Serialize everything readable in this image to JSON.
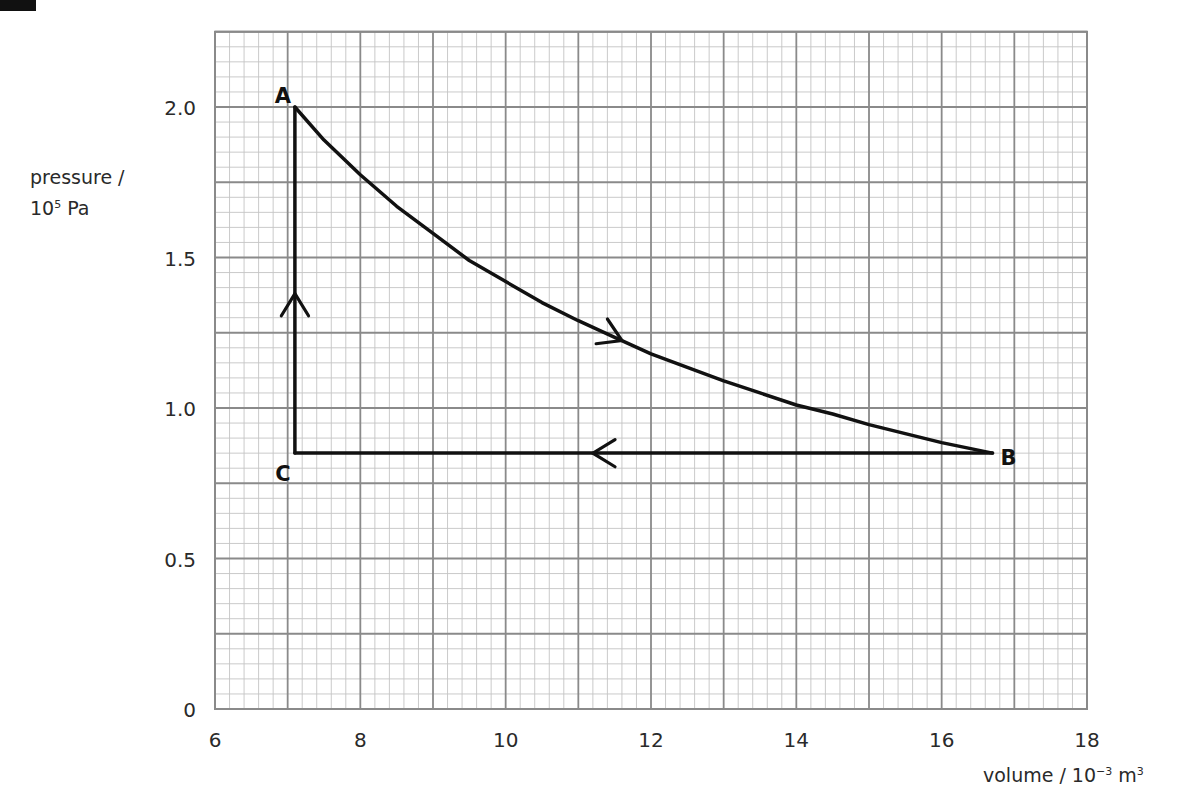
{
  "chart_data": {
    "type": "line",
    "title": "",
    "xlabel": "volume / 10⁻³ m³",
    "xlabel_parts": {
      "main": "volume / 10",
      "sup": "−3",
      "unit": " m",
      "unit_sup": "3"
    },
    "ylabel": "pressure / 10⁵ Pa",
    "ylabel_parts": {
      "line1": "pressure /",
      "base": "10",
      "sup": "5",
      "unit": " Pa"
    },
    "xlim": [
      6,
      18
    ],
    "ylim": [
      0,
      2.25
    ],
    "x_ticks": [
      6,
      8,
      10,
      12,
      14,
      16,
      18
    ],
    "x_tick_labels": [
      "6",
      "8",
      "10",
      "12",
      "14",
      "16",
      "18"
    ],
    "y_ticks": [
      0,
      0.5,
      1.0,
      1.5,
      2.0
    ],
    "y_tick_labels": [
      "0",
      "0.5",
      "1.0",
      "1.5",
      "2.0"
    ],
    "grid": {
      "on": true,
      "x_major_step": 1,
      "x_minor_step": 0.2,
      "y_major_step": 0.25,
      "y_minor_step": 0.05,
      "major_color": "#8a8a8a",
      "minor_color": "#c4c4c4"
    },
    "line_color": "#111111",
    "points": [
      {
        "label": "A",
        "volume": 7.1,
        "pressure": 2.0
      },
      {
        "label": "B",
        "volume": 16.7,
        "pressure": 0.85
      },
      {
        "label": "C",
        "volume": 7.1,
        "pressure": 0.85
      }
    ],
    "series": [
      {
        "name": "A→B (isothermal expansion curve)",
        "x": [
          7.1,
          7.5,
          8.0,
          8.5,
          9.0,
          9.5,
          10.0,
          10.5,
          11.0,
          11.5,
          12.0,
          12.5,
          13.0,
          13.5,
          14.0,
          14.5,
          15.0,
          15.5,
          16.0,
          16.7
        ],
        "y": [
          2.0,
          1.89,
          1.775,
          1.67,
          1.58,
          1.49,
          1.42,
          1.35,
          1.29,
          1.235,
          1.18,
          1.135,
          1.09,
          1.05,
          1.01,
          0.98,
          0.945,
          0.915,
          0.885,
          0.85
        ],
        "arrow": {
          "at_x": 11.6,
          "direction": "forward"
        }
      },
      {
        "name": "B→C (constant pressure)",
        "x": [
          16.7,
          7.1
        ],
        "y": [
          0.85,
          0.85
        ],
        "arrow": {
          "at_x": 11.2,
          "direction": "forward"
        }
      },
      {
        "name": "C→A (constant volume)",
        "x": [
          7.1,
          7.1
        ],
        "y": [
          0.85,
          2.0
        ],
        "arrow": {
          "at_y": 1.38,
          "direction": "forward"
        }
      }
    ],
    "legend": null
  }
}
